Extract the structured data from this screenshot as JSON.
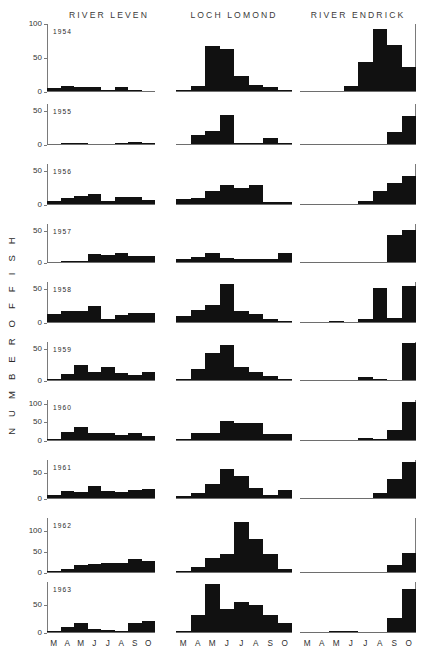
{
  "figure": {
    "ylabel": "N U M B E R   O F   F I S H",
    "columns": [
      {
        "title": "RIVER LEVEN"
      },
      {
        "title": "LOCH LOMOND"
      },
      {
        "title": "RIVER ENDRICK"
      }
    ],
    "months": [
      "M",
      "A",
      "M",
      "J",
      "J",
      "A",
      "S",
      "O"
    ]
  },
  "chart_data": {
    "type": "bar",
    "title": "",
    "subtitle": "",
    "xlabel": "",
    "ylabel": "NUMBER OF FISH",
    "grid": false,
    "legend": "none",
    "layout": "small-multiples grid, 10 year-rows x 3 site-columns",
    "categories": [
      "M",
      "A",
      "M",
      "J",
      "J",
      "A",
      "S",
      "O"
    ],
    "category_names": [
      "March",
      "April",
      "May",
      "June",
      "July",
      "August",
      "September",
      "October"
    ],
    "sites": [
      "RIVER LEVEN",
      "LOCH LOMOND",
      "RIVER ENDRICK"
    ],
    "years": [
      1954,
      1955,
      1956,
      1957,
      1958,
      1959,
      1960,
      1961,
      1962,
      1963
    ],
    "rows": [
      {
        "year": "1954",
        "ylim": [
          0,
          100
        ],
        "yticks": [
          0,
          50,
          100
        ],
        "panels": [
          {
            "site": "RIVER LEVEN",
            "values": [
              4,
              7,
              6,
              6,
              2,
              6,
              1,
              0
            ]
          },
          {
            "site": "LOCH LOMOND",
            "values": [
              1,
              7,
              67,
              63,
              22,
              9,
              6,
              2
            ]
          },
          {
            "site": "RIVER ENDRICK",
            "values": [
              0,
              0,
              0,
              8,
              44,
              93,
              68,
              36
            ]
          }
        ]
      },
      {
        "year": "1955",
        "ylim": [
          0,
          60
        ],
        "yticks": [
          0,
          50
        ],
        "panels": [
          {
            "site": "RIVER LEVEN",
            "values": [
              0,
              1,
              1,
              0,
              0,
              1,
              3,
              2
            ]
          },
          {
            "site": "LOCH LOMOND",
            "values": [
              0,
              13,
              19,
              43,
              1,
              1,
              9,
              2
            ]
          },
          {
            "site": "RIVER ENDRICK",
            "values": [
              0,
              0,
              0,
              0,
              0,
              0,
              18,
              42
            ]
          }
        ]
      },
      {
        "year": "1956",
        "ylim": [
          0,
          60
        ],
        "yticks": [
          0,
          50
        ],
        "panels": [
          {
            "site": "RIVER LEVEN",
            "values": [
              4,
              9,
              12,
              15,
              5,
              11,
              11,
              6
            ]
          },
          {
            "site": "LOCH LOMOND",
            "values": [
              7,
              9,
              20,
              29,
              24,
              28,
              3,
              3
            ]
          },
          {
            "site": "RIVER ENDRICK",
            "values": [
              0,
              0,
              0,
              0,
              5,
              19,
              32,
              42
            ]
          }
        ]
      },
      {
        "year": "1957",
        "ylim": [
          0,
          60
        ],
        "yticks": [
          0,
          50
        ],
        "panels": [
          {
            "site": "RIVER LEVEN",
            "values": [
              0,
              1,
              2,
              12,
              11,
              14,
              10,
              9
            ]
          },
          {
            "site": "LOCH LOMOND",
            "values": [
              5,
              8,
              14,
              6,
              5,
              5,
              4,
              14
            ]
          },
          {
            "site": "RIVER ENDRICK",
            "values": [
              0,
              0,
              0,
              0,
              0,
              0,
              43,
              50
            ]
          }
        ]
      },
      {
        "year": "1958",
        "ylim": [
          0,
          60
        ],
        "yticks": [
          0,
          50
        ],
        "panels": [
          {
            "site": "RIVER LEVEN",
            "values": [
              12,
              17,
              16,
              24,
              5,
              11,
              13,
              13
            ]
          },
          {
            "site": "LOCH LOMOND",
            "values": [
              9,
              18,
              26,
              57,
              17,
              12,
              5,
              1
            ]
          },
          {
            "site": "RIVER ENDRICK",
            "values": [
              0,
              0,
              2,
              0,
              5,
              51,
              6,
              54
            ]
          }
        ]
      },
      {
        "year": "1959",
        "ylim": [
          0,
          60
        ],
        "yticks": [
          0,
          50
        ],
        "panels": [
          {
            "site": "RIVER LEVEN",
            "values": [
              2,
              10,
              23,
              12,
              20,
              11,
              8,
              12
            ]
          },
          {
            "site": "LOCH LOMOND",
            "values": [
              2,
              17,
              43,
              55,
              21,
              13,
              6,
              1
            ]
          },
          {
            "site": "RIVER ENDRICK",
            "values": [
              0,
              0,
              0,
              0,
              4,
              1,
              0,
              58
            ]
          }
        ]
      },
      {
        "year": "1960",
        "ylim": [
          0,
          110
        ],
        "yticks": [
          0,
          50,
          100
        ],
        "panels": [
          {
            "site": "RIVER LEVEN",
            "values": [
              3,
              22,
              36,
              20,
              19,
              15,
              20,
              10
            ]
          },
          {
            "site": "LOCH LOMOND",
            "values": [
              2,
              18,
              19,
              53,
              47,
              46,
              16,
              17
            ]
          },
          {
            "site": "RIVER ENDRICK",
            "values": [
              0,
              0,
              0,
              0,
              6,
              2,
              28,
              105
            ]
          }
        ]
      },
      {
        "year": "1961",
        "ylim": [
          0,
          75
        ],
        "yticks": [
          0,
          50
        ],
        "panels": [
          {
            "site": "RIVER LEVEN",
            "values": [
              6,
              13,
              12,
              23,
              13,
              11,
              16,
              17
            ]
          },
          {
            "site": "LOCH LOMOND",
            "values": [
              3,
              10,
              28,
              58,
              43,
              20,
              5,
              15
            ]
          },
          {
            "site": "RIVER ENDRICK",
            "values": [
              0,
              0,
              0,
              0,
              0,
              9,
              38,
              72
            ]
          }
        ]
      },
      {
        "year": "1962",
        "ylim": [
          0,
          130
        ],
        "yticks": [
          0,
          50,
          100
        ],
        "panels": [
          {
            "site": "RIVER LEVEN",
            "values": [
              2,
              8,
              16,
              20,
              21,
              22,
              31,
              26
            ]
          },
          {
            "site": "LOCH LOMOND",
            "values": [
              3,
              12,
              33,
              44,
              120,
              79,
              44,
              8
            ]
          },
          {
            "site": "RIVER ENDRICK",
            "values": [
              0,
              0,
              0,
              0,
              0,
              0,
              18,
              45
            ]
          }
        ]
      },
      {
        "year": "1963",
        "ylim": [
          0,
          90
        ],
        "yticks": [
          0,
          50
        ],
        "panels": [
          {
            "site": "RIVER LEVEN",
            "values": [
              2,
              9,
              17,
              6,
              4,
              2,
              16,
              20
            ]
          },
          {
            "site": "LOCH LOMOND",
            "values": [
              2,
              30,
              87,
              42,
              54,
              48,
              30,
              16
            ]
          },
          {
            "site": "RIVER ENDRICK",
            "values": [
              0,
              0,
              1,
              2,
              0,
              0,
              26,
              78
            ]
          }
        ]
      }
    ]
  }
}
